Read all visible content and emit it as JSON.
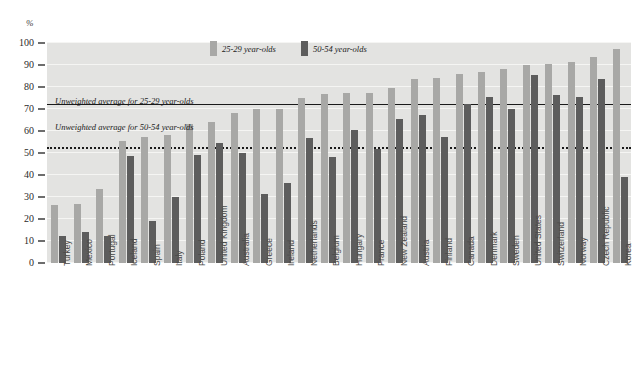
{
  "chart_data": {
    "type": "bar",
    "title": "",
    "subtitle": "",
    "xlabel": "",
    "ylabel": "%",
    "ylim": [
      0,
      100
    ],
    "y_ticks": [
      0,
      10,
      20,
      30,
      40,
      50,
      60,
      70,
      80,
      90,
      100
    ],
    "grid": true,
    "legend_position": "top-center",
    "orientation": "vertical-grouped",
    "categories": [
      "Turkey",
      "Mexico",
      "Portugal",
      "Iceland",
      "Spain",
      "Italy",
      "Poland",
      "United Kingdom",
      "Australia",
      "Greece",
      "Ireland",
      "Netherlands",
      "Belgium",
      "Hungary",
      "France",
      "New Zealand",
      "Austria",
      "Finland",
      "Canada",
      "Denmark",
      "Sweden",
      "United States",
      "Switzerland",
      "Norway",
      "Czech Republic",
      "Korea"
    ],
    "series": [
      {
        "name": "25-29 year-olds",
        "color": "#a8a8a6",
        "values": [
          26.5,
          27.0,
          33.5,
          55.5,
          57.5,
          58.0,
          63.0,
          64.0,
          68.0,
          70.0,
          70.0,
          75.0,
          77.0,
          77.5,
          77.5,
          79.5,
          83.5,
          84.0,
          86.0,
          87.0,
          88.0,
          90.0,
          90.5,
          91.5,
          93.5,
          97.5
        ]
      },
      {
        "name": "50-54 year-olds",
        "color": "#5d5d5d",
        "values": [
          12.5,
          14.0,
          12.5,
          48.5,
          19.0,
          30.0,
          49.0,
          54.5,
          50.0,
          31.5,
          36.5,
          57.0,
          48.0,
          60.5,
          52.0,
          65.5,
          67.5,
          57.5,
          72.5,
          75.5,
          70.0,
          85.5,
          76.5,
          75.5,
          83.5,
          39.0
        ]
      }
    ],
    "annotations": [
      {
        "id": "unweighted-average-25-29",
        "text": "Unweighted average for 25-29 year-olds",
        "line_style": "solid",
        "value": 72.0
      },
      {
        "id": "unweighted-average-50-54",
        "text": "Unweighted average",
        "text_line2": "for 50-54 year-olds",
        "line_style": "dotted",
        "value": 52.0
      }
    ]
  },
  "axis": {
    "y_unit_label": "%"
  },
  "legend": {
    "items": [
      {
        "label": "25-29 year-olds",
        "color": "#a8a8a6"
      },
      {
        "label": "50-54 year-olds",
        "color": "#5d5d5d"
      }
    ]
  },
  "colors": {
    "plot_background": "#e3e3e1",
    "gridline": "#f5f5f3",
    "series_light": "#a8a8a6",
    "series_dark": "#5d5d5d",
    "reference_line": "#1a1a1a",
    "text": "#2b2b2b"
  }
}
